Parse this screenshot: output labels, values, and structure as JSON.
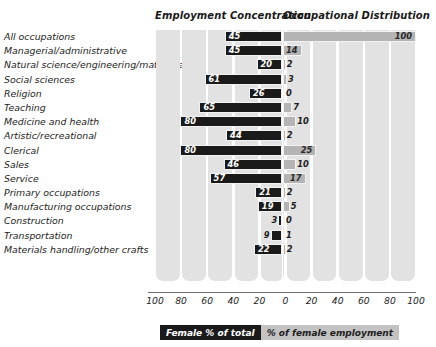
{
  "header": {
    "left_title": "Employment Concentration",
    "right_title": "Occupational Distribution"
  },
  "legend": {
    "dark_label": "Female % of total",
    "light_label": "% of female employment",
    "dark_color": "#1a1a1a",
    "light_color": "#b4b4b4"
  },
  "axis": {
    "ticks": [
      "100",
      "80",
      "60",
      "40",
      "20",
      "0",
      "20",
      "40",
      "60",
      "80",
      "100"
    ]
  },
  "chart_data": {
    "type": "bar",
    "orientation": "horizontal",
    "style": "diverging-butterfly",
    "title": "",
    "subtitle": "",
    "xlabel": "",
    "ylabel": "",
    "xlim_left": [
      0,
      100
    ],
    "xlim_right": [
      0,
      100
    ],
    "grid": true,
    "legend_position": "bottom",
    "categories": [
      "All occupations",
      "Managerial/administrative",
      "Natural science/engineering/mathematics",
      "Social sciences",
      "Religion",
      "Teaching",
      "Medicine and health",
      "Artistic/recreational",
      "Clerical",
      "Sales",
      "Service",
      "Primary occupations",
      "Manufacturing occupations",
      "Construction",
      "Transportation",
      "Materials handling/other crafts"
    ],
    "series": [
      {
        "name": "Female % of total",
        "side": "left",
        "color": "#1a1a1a",
        "values": [
          45,
          45,
          20,
          61,
          26,
          65,
          80,
          44,
          80,
          46,
          57,
          21,
          19,
          3,
          9,
          22
        ]
      },
      {
        "name": "% of female employment",
        "side": "right",
        "color": "#b4b4b4",
        "values": [
          100,
          14,
          2,
          3,
          0,
          7,
          10,
          2,
          25,
          10,
          17,
          2,
          5,
          0,
          1,
          2
        ]
      }
    ]
  }
}
